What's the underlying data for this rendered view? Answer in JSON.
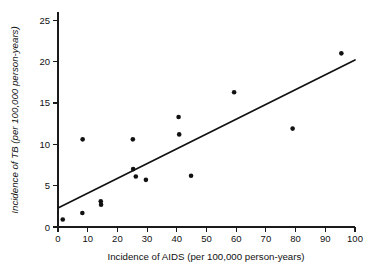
{
  "chart_data": {
    "type": "scatter",
    "title": "",
    "xlabel": "Incidence of AIDS (per 100,000 person-years)",
    "ylabel": "Incidence of TB (per 100,000 person-years)",
    "xlim": [
      0,
      100
    ],
    "ylim": [
      0,
      26
    ],
    "xticks": [
      0,
      10,
      20,
      30,
      40,
      50,
      60,
      70,
      80,
      90,
      100
    ],
    "yticks": [
      0,
      5,
      10,
      15,
      20,
      25
    ],
    "xtick_labels": [
      "0",
      "10",
      "20",
      "30",
      "40",
      "50",
      "60",
      "70",
      "80",
      "90",
      "100"
    ],
    "ytick_labels": [
      "0",
      "5",
      "10",
      "15",
      "20",
      "25"
    ],
    "grid": false,
    "legend": "none",
    "point_color": "#111111",
    "line_color": "#111111",
    "points": [
      {
        "x": 1.6,
        "y": 0.9
      },
      {
        "x": 8.2,
        "y": 1.7
      },
      {
        "x": 8.3,
        "y": 10.6
      },
      {
        "x": 14.4,
        "y": 3.1
      },
      {
        "x": 14.5,
        "y": 2.7
      },
      {
        "x": 25.2,
        "y": 10.6
      },
      {
        "x": 25.3,
        "y": 7.0
      },
      {
        "x": 26.2,
        "y": 6.1
      },
      {
        "x": 29.6,
        "y": 5.7
      },
      {
        "x": 40.6,
        "y": 13.3
      },
      {
        "x": 40.8,
        "y": 11.2
      },
      {
        "x": 44.8,
        "y": 6.2
      },
      {
        "x": 59.3,
        "y": 16.3
      },
      {
        "x": 79.0,
        "y": 11.9
      },
      {
        "x": 95.4,
        "y": 21.0
      }
    ],
    "fit_line": {
      "type": "linear-regression",
      "x_start": 0,
      "y_start": 2.3,
      "x_end": 100,
      "y_end": 20.2
    }
  }
}
